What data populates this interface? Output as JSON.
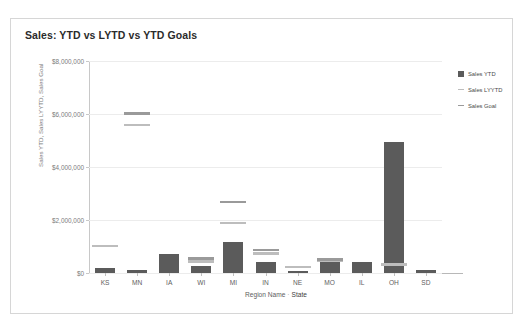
{
  "card": {
    "title": "Sales: YTD vs LYTD vs YTD Goals"
  },
  "legend": {
    "position": "right",
    "items": [
      {
        "label": "Sales YTD",
        "marker": "square",
        "color": "#5b5b5b"
      },
      {
        "label": "Sales LYYTD",
        "marker": "line",
        "color": "#bdbdbd"
      },
      {
        "label": "Sales Goal",
        "marker": "line",
        "color": "#9a9a9a"
      }
    ]
  },
  "chart_data": {
    "type": "bar",
    "title": "Sales: YTD vs LYTD vs YTD Goals",
    "xlabel_fields": [
      "Region Name",
      "State"
    ],
    "xlabel_separator": "·",
    "ylabel": "Sales YTD, Sales LYYTD, Sales Goal",
    "ylim": [
      0,
      8000000
    ],
    "yticks": [
      0,
      2000000,
      4000000,
      6000000,
      8000000
    ],
    "ytick_labels": [
      "$0",
      "$2,000,000",
      "$4,000,000",
      "$6,000,000",
      "$8,000,000"
    ],
    "grid": true,
    "categories": [
      "KS",
      "MN",
      "IA",
      "WI",
      "MI",
      "IN",
      "NE",
      "MO",
      "IL",
      "OH",
      "SD"
    ],
    "series": [
      {
        "name": "Sales YTD",
        "type": "bar",
        "color": "#5b5b5b",
        "values": [
          190000,
          110000,
          720000,
          250000,
          1180000,
          400000,
          80000,
          400000,
          420000,
          4950000,
          120000
        ]
      },
      {
        "name": "Sales LYYTD",
        "type": "reference-line",
        "color": "#bdbdbd",
        "values": [
          1020000,
          5600000,
          null,
          450000,
          1900000,
          750000,
          230000,
          470000,
          null,
          330000,
          null
        ]
      },
      {
        "name": "Sales Goal",
        "type": "reference-line",
        "color": "#9a9a9a",
        "values": [
          null,
          6020000,
          null,
          560000,
          2680000,
          880000,
          null,
          520000,
          null,
          null,
          null
        ]
      }
    ]
  }
}
